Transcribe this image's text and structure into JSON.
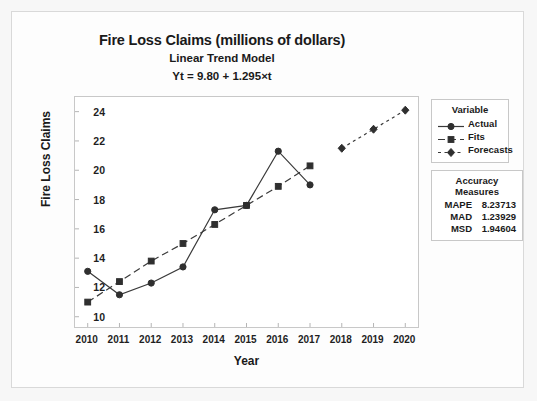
{
  "chart_data": {
    "type": "line",
    "title": "Fire Loss Claims (millions of dollars)",
    "subtitle": "Linear Trend Model",
    "equation": "Yt = 9.80 + 1.295×t",
    "xlabel": "Year",
    "ylabel": "Fire Loss Claims",
    "x": [
      2010,
      2011,
      2012,
      2013,
      2014,
      2015,
      2016,
      2017,
      2018,
      2019,
      2020
    ],
    "xticklabels": [
      "2010",
      "2011",
      "2012",
      "2013",
      "2014",
      "2015",
      "2016",
      "2017",
      "2018",
      "2019",
      "2020"
    ],
    "yticklabels": [
      "10",
      "12",
      "14",
      "16",
      "18",
      "20",
      "22",
      "24"
    ],
    "yticks": [
      10,
      12,
      14,
      16,
      18,
      20,
      22,
      24
    ],
    "ylim": [
      9.3,
      25.0
    ],
    "xlim": [
      2009.6,
      2020.4
    ],
    "grid": false,
    "legend_position": "right",
    "series": [
      {
        "name": "Actual",
        "marker": "circle",
        "linestyle": "solid",
        "color": "#333333",
        "x": [
          2010,
          2011,
          2012,
          2013,
          2014,
          2015,
          2016,
          2017
        ],
        "values": [
          13.1,
          11.5,
          12.3,
          13.4,
          17.3,
          17.6,
          21.3,
          19.0
        ]
      },
      {
        "name": "Fits",
        "marker": "square",
        "linestyle": "dashed",
        "color": "#333333",
        "x": [
          2010,
          2011,
          2012,
          2013,
          2014,
          2015,
          2016,
          2017
        ],
        "values": [
          11.0,
          12.4,
          13.8,
          15.0,
          16.3,
          17.6,
          18.9,
          20.3
        ]
      },
      {
        "name": "Forecasts",
        "marker": "diamond",
        "linestyle": "dotted",
        "color": "#333333",
        "x": [
          2018,
          2019,
          2020
        ],
        "values": [
          21.5,
          22.8,
          24.1
        ]
      }
    ]
  },
  "legend": {
    "title": "Variable",
    "items": [
      {
        "label": "Actual"
      },
      {
        "label": "Fits"
      },
      {
        "label": "Forecasts"
      }
    ]
  },
  "accuracy": {
    "title": "Accuracy Measures",
    "rows": [
      {
        "name": "MAPE",
        "value": "8.23713"
      },
      {
        "name": "MAD",
        "value": "1.23929"
      },
      {
        "name": "MSD",
        "value": "1.94604"
      }
    ]
  }
}
